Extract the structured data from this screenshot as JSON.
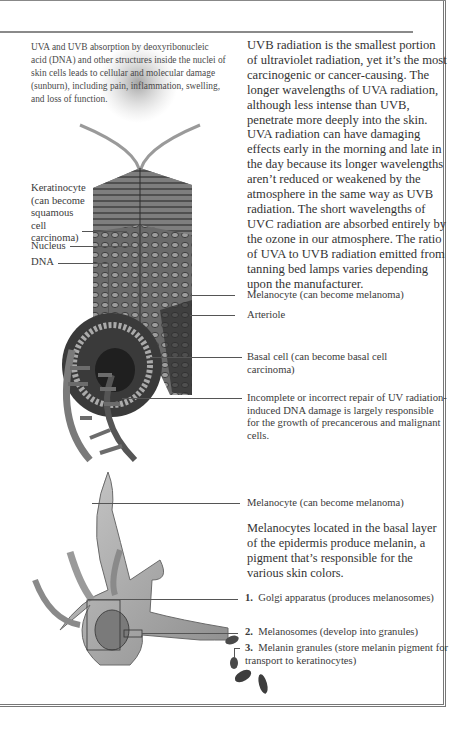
{
  "intro_caption": "UVA and UVB absorption by deoxyribonucleic acid (DNA) and other structures inside the nuclei of skin cells leads to cellular and molecular damage (sunburn), including pain, inflammation, swelling, and loss of function.",
  "main_paragraph": "UVB radiation is the smallest portion of ultraviolet radiation, yet it’s the most carcinogenic or cancer-causing. The longer wavelengths of UVA radiation, although less intense than UVB, penetrate more deeply into the skin. UVA radiation can have damaging effects early in the morning and late in the day because its longer wavelengths aren’t reduced or weakened by the atmosphere in the same way as UVB radiation. The short wavelengths of UVC radiation are absorbed entirely by the ozone in our atmosphere. The ratio of UVA to UVB radiation emitted from tanning bed lamps varies depending upon the manufacturer.",
  "skin_labels": {
    "keratinocyte": "Keratinocyte (can become squamous cell carcinoma)",
    "nucleus": "Nucleus",
    "dna": "DNA",
    "melanocyte": "Melanocyte (can become melanoma)",
    "arteriole": "Arteriole",
    "basal_cell": "Basal cell (can become basal cell carcinoma)",
    "repair_note": "Incomplete or incorrect repair of UV radiation-induced DNA damage is largely responsible for the growth of precancerous and malignant cells."
  },
  "melanocyte_section": {
    "label": "Melanocyte (can become melanoma)",
    "description": "Melanocytes located in the basal layer of the epidermis produce melanin, a pigment that’s responsible for the various skin colors.",
    "parts": [
      {
        "number": "1.",
        "text": "Golgi apparatus (produces melanosomes)"
      },
      {
        "number": "2.",
        "text": "Melanosomes (develop into granules)"
      },
      {
        "number": "3.",
        "text": "Melanin granules (store melanin pigment for transport to keratinocytes)"
      }
    ]
  }
}
